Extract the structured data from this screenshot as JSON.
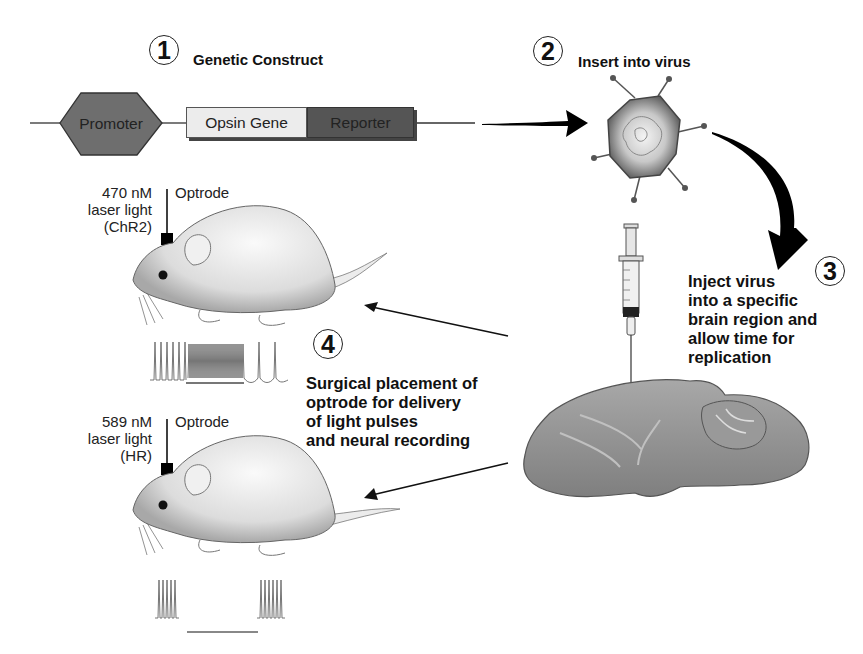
{
  "steps": [
    {
      "number": "1",
      "title": "Genetic Construct"
    },
    {
      "number": "2",
      "title": "Insert into virus"
    },
    {
      "number": "3",
      "title": "Inject virus\ninto a specific\nbrain region and\nallow time for\nreplication"
    },
    {
      "number": "4",
      "title": "Surgical placement of\noptrode for delivery\nof light pulses\nand neural recording"
    }
  ],
  "construct": {
    "promoter": "Promoter",
    "opsin_gene": "Opsin Gene",
    "reporter": "Reporter"
  },
  "mouse_top": {
    "laser_label": "470 nM\nlaser light\n(ChR2)",
    "optrode_label": "Optrode",
    "effect": "excitation"
  },
  "mouse_bottom": {
    "laser_label": "589 nM\nlaser light\n(HR)",
    "optrode_label": "Optrode",
    "effect": "inhibition"
  },
  "colors": {
    "promoter_fill": "#6e6e6e",
    "opsin_fill": "#ececec",
    "reporter_fill": "#555555",
    "arrow": "#000000",
    "brain": "#8f8f8f"
  }
}
